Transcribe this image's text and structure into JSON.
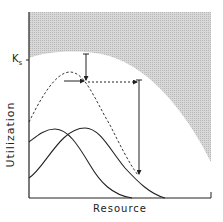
{
  "diagram": {
    "x_axis_label": "Resource",
    "y_axis_label": "Utilization",
    "ks_label": "K",
    "ks_subscript": "s",
    "colors": {
      "line": "#222222",
      "shade": "#cfcfcf",
      "background": "#ffffff"
    },
    "elements": [
      "shaded infeasible region above saturation curve",
      "dashed combined utilization curve",
      "two solid utilization curves",
      "arrows indicating shift along resource axis"
    ]
  }
}
